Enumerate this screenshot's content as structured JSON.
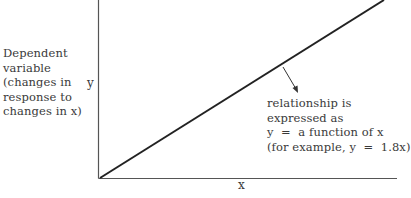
{
  "diagram": {
    "type": "linear-relationship-graph",
    "y_axis": {
      "label": "y",
      "description_lines": [
        "Dependent",
        "variable",
        "(changes in",
        "response to",
        "changes in x)"
      ]
    },
    "x_axis": {
      "label": "x"
    },
    "line": {
      "description": "straight line from origin rising to the upper right"
    },
    "annotation": {
      "lines": [
        "relationship is",
        "expressed as",
        "y  =  a function of x",
        "(for example, y  =  1.8x)"
      ]
    },
    "colors": {
      "axis": "#555555",
      "line": "#222222",
      "text": "#3a3a3a",
      "background": "#ffffff"
    }
  }
}
